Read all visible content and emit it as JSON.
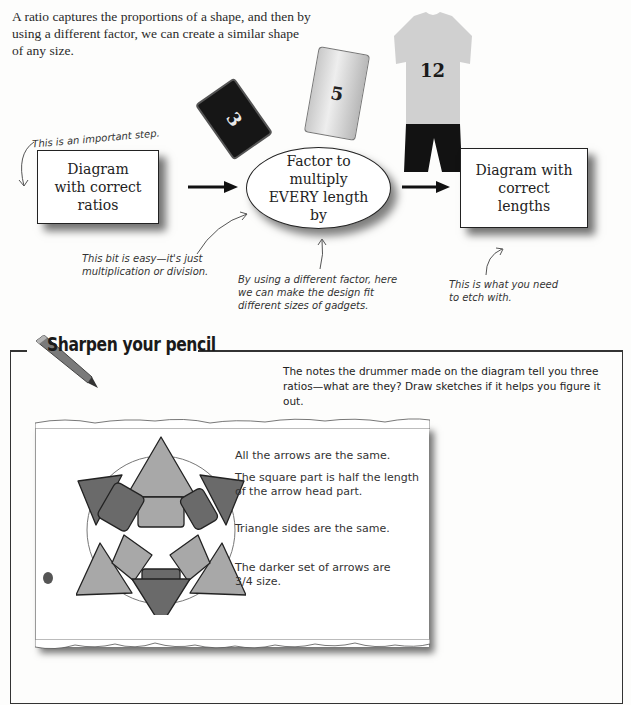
{
  "intro": {
    "text": "A ratio captures the proportions of a shape, and then by using a different factor, we can create a similar shape of any size."
  },
  "gadgets": {
    "card_black_number": "3",
    "card_grey_number": "5",
    "shirt_number": "12"
  },
  "flow": {
    "annotation_top": "This is an important step.",
    "box_left": "Diagram with correct ratios",
    "ellipse": "Factor to multiply EVERY length by",
    "box_right": "Diagram with correct lengths",
    "annotation_left": "This bit is easy—it's just multiplication or division.",
    "annotation_middle": "By using a different factor, here we can make the design fit different sizes of gadgets.",
    "annotation_right": "This is what you need to etch with."
  },
  "exercise": {
    "title": "Sharpen your pencil",
    "instructions": "The notes the drummer made on the diagram tell you three ratios—what are they? Draw sketches if it helps you figure it out.",
    "notes": [
      "All the arrows are the same.",
      "The square part is half the length of the arrow head part.",
      "Triangle sides are the same.",
      "The darker set of arrows are 3/4 size."
    ],
    "colors": {
      "light_arrow": "#a8a8a8",
      "dark_arrow": "#6a6a6a",
      "outline": "#222222"
    }
  }
}
